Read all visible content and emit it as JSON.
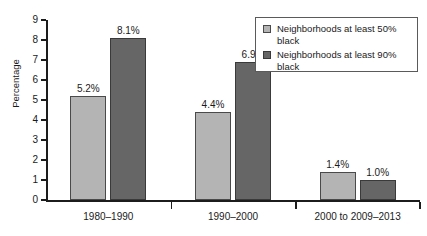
{
  "chart_data": {
    "type": "bar",
    "title": "",
    "xlabel": "",
    "ylabel": "Percentage",
    "ylim": [
      0,
      9
    ],
    "ytick_labels": [
      "0",
      "1",
      "2",
      "3",
      "4",
      "5",
      "6",
      "7",
      "8",
      "9"
    ],
    "grid": false,
    "legend_position": "top-right",
    "categories": [
      "1980–1990",
      "1990–2000",
      "2000 to 2009–2013"
    ],
    "series": [
      {
        "name": "Neighborhoods at least 50% black",
        "color": "#b4b4b4",
        "values": [
          5.2,
          4.4,
          1.4
        ],
        "labels": [
          "5.2%",
          "4.4%",
          "1.4%"
        ]
      },
      {
        "name": "Neighborhoods at least 90% black",
        "color": "#666666",
        "values": [
          8.1,
          6.9,
          1.0
        ],
        "labels": [
          "8.1%",
          "6.9%",
          "1.0%"
        ]
      }
    ]
  },
  "legend": {
    "entries": [
      {
        "label": "Neighborhoods at least 50% black",
        "swatch": "light-gray-swatch"
      },
      {
        "label": "Neighborhoods at least 90% black",
        "swatch": "dark-gray-swatch"
      }
    ]
  }
}
